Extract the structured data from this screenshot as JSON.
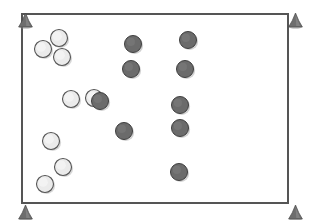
{
  "scene": {
    "title": "Field Layout Diagram",
    "type": "top-down-field-plan",
    "canvas": {
      "width": 310,
      "height": 220,
      "background": "#ffffff"
    },
    "field": {
      "label": "playing-field-boundary",
      "shape": "rectangle",
      "x": 22,
      "y": 14,
      "width": 266,
      "height": 189,
      "fill": "#ffffff",
      "stroke": "#555555",
      "stroke_width": 1.4
    },
    "colors": {
      "cone": "#6e6e6e",
      "cone_outline": "#4a4a4a",
      "light_marker_fill": "#ebebeb",
      "light_marker_stroke": "#555555",
      "dark_marker_fill": "#6b6b6b",
      "dark_marker_stroke": "#3f3f3f",
      "field_stroke": "#555555",
      "background": "#ffffff"
    },
    "cones": [
      {
        "name": "cone-top-left",
        "x": 18,
        "y": 13,
        "w": 15,
        "h": 15
      },
      {
        "name": "cone-top-right",
        "x": 288,
        "y": 13,
        "w": 15,
        "h": 15
      },
      {
        "name": "cone-bottom-left",
        "x": 18,
        "y": 205,
        "w": 15,
        "h": 15
      },
      {
        "name": "cone-bottom-right",
        "x": 288,
        "y": 205,
        "w": 15,
        "h": 15
      }
    ],
    "markers": [
      {
        "name": "light-marker-1",
        "group": "light",
        "cx": 59,
        "cy": 38,
        "r": 8.5
      },
      {
        "name": "light-marker-2",
        "group": "light",
        "cx": 43,
        "cy": 49,
        "r": 8.5
      },
      {
        "name": "light-marker-3",
        "group": "light",
        "cx": 62,
        "cy": 57,
        "r": 8.5
      },
      {
        "name": "light-marker-4",
        "group": "light",
        "cx": 71,
        "cy": 99,
        "r": 8.5
      },
      {
        "name": "light-marker-5",
        "group": "light",
        "cx": 94,
        "cy": 98,
        "r": 8.5
      },
      {
        "name": "light-marker-6",
        "group": "light",
        "cx": 51,
        "cy": 141,
        "r": 8.5
      },
      {
        "name": "light-marker-7",
        "group": "light",
        "cx": 63,
        "cy": 167,
        "r": 8.5
      },
      {
        "name": "light-marker-8",
        "group": "light",
        "cx": 45,
        "cy": 184,
        "r": 8.5
      },
      {
        "name": "dark-marker-1",
        "group": "dark",
        "cx": 133,
        "cy": 44,
        "r": 8.5
      },
      {
        "name": "dark-marker-2",
        "group": "dark",
        "cx": 131,
        "cy": 69,
        "r": 8.5
      },
      {
        "name": "dark-marker-3",
        "group": "dark",
        "cx": 100,
        "cy": 101,
        "r": 8.5
      },
      {
        "name": "dark-marker-4",
        "group": "dark",
        "cx": 124,
        "cy": 131,
        "r": 8.5
      },
      {
        "name": "dark-marker-5",
        "group": "dark",
        "cx": 188,
        "cy": 40,
        "r": 8.5
      },
      {
        "name": "dark-marker-6",
        "group": "dark",
        "cx": 185,
        "cy": 69,
        "r": 8.5
      },
      {
        "name": "dark-marker-7",
        "group": "dark",
        "cx": 180,
        "cy": 105,
        "r": 8.5
      },
      {
        "name": "dark-marker-8",
        "group": "dark",
        "cx": 180,
        "cy": 128,
        "r": 8.5
      },
      {
        "name": "dark-marker-9",
        "group": "dark",
        "cx": 179,
        "cy": 172,
        "r": 8.5
      }
    ],
    "counts": {
      "light_markers": 8,
      "dark_markers": 9,
      "cones": 4
    }
  },
  "chart_data": {
    "type": "scatter",
    "xlabel": "",
    "ylabel": "",
    "xlim": [
      22,
      288
    ],
    "ylim": [
      14,
      203
    ],
    "grid": false,
    "legend": "none",
    "series": [
      {
        "name": "light markers",
        "color": "#ebebeb",
        "marker": "circle-outline",
        "points": [
          [
            59,
            38
          ],
          [
            43,
            49
          ],
          [
            62,
            57
          ],
          [
            71,
            99
          ],
          [
            94,
            98
          ],
          [
            51,
            141
          ],
          [
            63,
            167
          ],
          [
            45,
            184
          ]
        ]
      },
      {
        "name": "dark markers",
        "color": "#6b6b6b",
        "marker": "circle-filled",
        "points": [
          [
            133,
            44
          ],
          [
            131,
            69
          ],
          [
            100,
            101
          ],
          [
            124,
            131
          ],
          [
            188,
            40
          ],
          [
            185,
            69
          ],
          [
            180,
            105
          ],
          [
            180,
            128
          ],
          [
            179,
            172
          ]
        ]
      },
      {
        "name": "corner cones",
        "color": "#6e6e6e",
        "marker": "triangle",
        "points": [
          [
            25,
            20
          ],
          [
            295,
            20
          ],
          [
            25,
            212
          ],
          [
            295,
            212
          ]
        ]
      }
    ]
  }
}
